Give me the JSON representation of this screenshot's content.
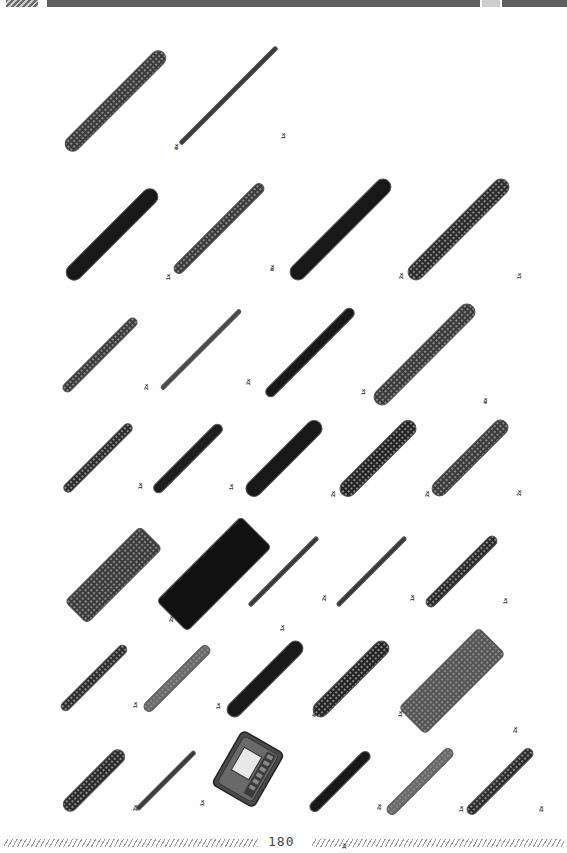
{
  "page": {
    "number": "180"
  },
  "colors": {
    "part_dark": "#1e1e1e",
    "part_outline": "#555555",
    "header_bar": "#5e5e5e"
  },
  "rows": [
    {
      "items": [
        {
          "type": "beam-wide",
          "qty": "4x",
          "x": 60,
          "y": 45,
          "w": 14,
          "len": 135,
          "fill": "#3a3a3a",
          "holes": true
        },
        {
          "type": "shaft",
          "qty": "1x",
          "x": 178,
          "y": 45,
          "w": 3,
          "len": 135,
          "fill": "#3a3a3a",
          "holes": false
        }
      ]
    },
    {
      "items": [
        {
          "type": "beam",
          "qty": "1x",
          "x": 60,
          "y": 183,
          "w": 15,
          "len": 122,
          "fill": "#181818",
          "holes": false
        },
        {
          "type": "beam-thin",
          "qty": "8x",
          "x": 170,
          "y": 180,
          "w": 9,
          "len": 122,
          "fill": "#3a3a3a",
          "holes": true
        },
        {
          "type": "beam",
          "qty": "2x",
          "x": 284,
          "y": 173,
          "w": 15,
          "len": 135,
          "fill": "#181818",
          "holes": false
        },
        {
          "type": "beam",
          "qty": "1x",
          "x": 402,
          "y": 173,
          "w": 15,
          "len": 135,
          "fill": "#2a2a2a",
          "holes": true
        }
      ]
    },
    {
      "items": [
        {
          "type": "beam-thin",
          "qty": "2x",
          "x": 60,
          "y": 315,
          "w": 8,
          "len": 100,
          "fill": "#3a3a3a",
          "holes": true
        },
        {
          "type": "shaft",
          "qty": "2x",
          "x": 160,
          "y": 308,
          "w": 3,
          "len": 110,
          "fill": "#4a4a4a",
          "holes": false
        },
        {
          "type": "beam-thin",
          "qty": "1x",
          "x": 262,
          "y": 305,
          "w": 9,
          "len": 120,
          "fill": "#181818",
          "holes": false
        },
        {
          "type": "beam-wide",
          "qty": "4x",
          "x": 368,
          "y": 298,
          "w": 15,
          "len": 135,
          "fill": "#3a3a3a",
          "holes": true
        }
      ]
    },
    {
      "items": [
        {
          "type": "beam-thin",
          "qty": "1x",
          "x": 60,
          "y": 420,
          "w": 8,
          "len": 92,
          "fill": "#2a2a2a",
          "holes": true
        },
        {
          "type": "beam-thin",
          "qty": "1x",
          "x": 150,
          "y": 420,
          "w": 9,
          "len": 92,
          "fill": "#1e1e1e",
          "holes": false
        },
        {
          "type": "beam",
          "qty": "2x",
          "x": 240,
          "y": 415,
          "w": 15,
          "len": 100,
          "fill": "#181818",
          "holes": false
        },
        {
          "type": "beam",
          "qty": "2x",
          "x": 334,
          "y": 415,
          "w": 15,
          "len": 100,
          "fill": "#222222",
          "holes": true
        },
        {
          "type": "beam",
          "qty": "2x",
          "x": 427,
          "y": 415,
          "w": 14,
          "len": 100,
          "fill": "#3a3a3a",
          "holes": true
        }
      ]
    },
    {
      "items": [
        {
          "type": "plate",
          "qty": "2x",
          "x": 60,
          "y": 522,
          "w": 30,
          "len": 105,
          "fill": "#3a3a3a",
          "holes": true
        },
        {
          "type": "plate",
          "qty": "1x",
          "x": 150,
          "y": 510,
          "w": 42,
          "len": 118,
          "fill": "#121212",
          "holes": false
        },
        {
          "type": "shaft",
          "qty": "2x",
          "x": 247,
          "y": 535,
          "w": 3,
          "len": 95,
          "fill": "#3a3a3a",
          "holes": false
        },
        {
          "type": "shaft",
          "qty": "1x",
          "x": 335,
          "y": 535,
          "w": 3,
          "len": 95,
          "fill": "#3a3a3a",
          "holes": false
        },
        {
          "type": "beam-thin",
          "qty": "1x",
          "x": 422,
          "y": 532,
          "w": 9,
          "len": 95,
          "fill": "#2a2a2a",
          "holes": true
        }
      ]
    },
    {
      "items": [
        {
          "type": "beam-thin",
          "qty": "1x",
          "x": 58,
          "y": 642,
          "w": 8,
          "len": 88,
          "fill": "#2a2a2a",
          "holes": true
        },
        {
          "type": "beam-thin",
          "qty": "1x",
          "x": 140,
          "y": 642,
          "w": 9,
          "len": 88,
          "fill": "#6a6a6a",
          "holes": true
        },
        {
          "type": "beam",
          "qty": "4x",
          "x": 222,
          "y": 636,
          "w": 14,
          "len": 100,
          "fill": "#181818",
          "holes": false
        },
        {
          "type": "beam",
          "qty": "1x",
          "x": 308,
          "y": 636,
          "w": 14,
          "len": 100,
          "fill": "#222222",
          "holes": true
        },
        {
          "type": "plate",
          "qty": "2x",
          "x": 393,
          "y": 622,
          "w": 36,
          "len": 112,
          "fill": "#555555",
          "holes": true
        }
      ]
    },
    {
      "items": [
        {
          "type": "beam",
          "qty": "2x",
          "x": 58,
          "y": 745,
          "w": 13,
          "len": 80,
          "fill": "#2a2a2a",
          "holes": true
        },
        {
          "type": "shaft",
          "qty": "1x",
          "x": 135,
          "y": 750,
          "w": 3,
          "len": 80,
          "fill": "#3a3a3a",
          "holes": false
        },
        {
          "type": "brain",
          "qty": "1x",
          "x": 212,
          "y": 728,
          "w": 68,
          "len": 80,
          "fill": "#5a5a5a",
          "holes": false
        },
        {
          "type": "beam-thin",
          "qty": "2x",
          "x": 306,
          "y": 748,
          "w": 9,
          "len": 80,
          "fill": "#181818",
          "holes": false
        },
        {
          "type": "beam-thin",
          "qty": "1x",
          "x": 383,
          "y": 745,
          "w": 9,
          "len": 88,
          "fill": "#6a6a6a",
          "holes": true
        },
        {
          "type": "beam-thin",
          "qty": "2x",
          "x": 463,
          "y": 745,
          "w": 9,
          "len": 88,
          "fill": "#2a2a2a",
          "holes": true
        }
      ]
    }
  ]
}
